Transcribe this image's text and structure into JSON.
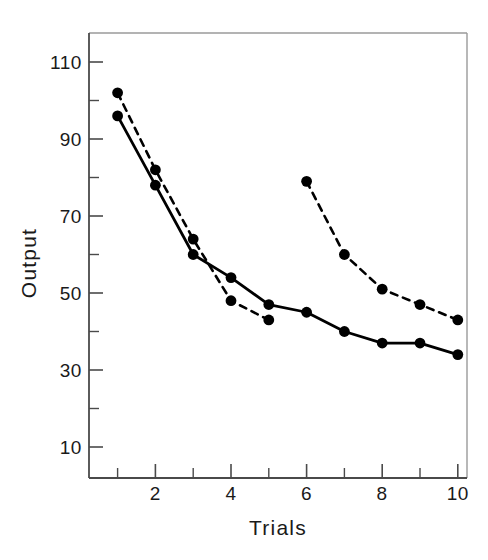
{
  "chart_data": {
    "type": "line",
    "title": "",
    "xlabel": "Trials",
    "ylabel": "Output",
    "x": [
      1,
      2,
      3,
      4,
      5,
      6,
      7,
      8,
      9,
      10
    ],
    "xlim": [
      0.5,
      10.5
    ],
    "ylim": [
      0,
      118
    ],
    "grid": false,
    "legend": "none",
    "xticks": [
      1,
      2,
      3,
      4,
      5,
      6,
      7,
      8,
      9,
      10
    ],
    "xticklabels": [
      "",
      "2",
      "",
      "4",
      "",
      "6",
      "",
      "8",
      "",
      "10"
    ],
    "yticks": [
      10,
      20,
      30,
      40,
      50,
      60,
      70,
      80,
      90,
      100,
      110
    ],
    "yticklabels": [
      "10",
      "",
      "30",
      "",
      "50",
      "",
      "70",
      "",
      "90",
      "",
      "110"
    ],
    "series": [
      {
        "name": "solid-series",
        "style": "solid",
        "marker": "filled-circle",
        "color": "#000000",
        "x": [
          1,
          2,
          3,
          4,
          5,
          6,
          7,
          8,
          9,
          10
        ],
        "values": [
          96,
          78,
          60,
          54,
          47,
          45,
          40,
          37,
          37,
          34
        ]
      },
      {
        "name": "dashed-series-first",
        "style": "dashed",
        "marker": "filled-circle",
        "color": "#000000",
        "x": [
          1,
          2,
          3,
          4,
          5
        ],
        "values": [
          102,
          82,
          64,
          48,
          43
        ]
      },
      {
        "name": "dashed-series-second",
        "style": "dashed",
        "marker": "filled-circle",
        "color": "#000000",
        "x": [
          6,
          7,
          8,
          9,
          10
        ],
        "values": [
          79,
          60,
          51,
          47,
          43
        ]
      }
    ]
  },
  "axes": {
    "y_axis_title": "Output",
    "x_axis_title": "Trials",
    "y_tick_labels": [
      "110",
      "90",
      "70",
      "50",
      "30",
      "10"
    ],
    "x_tick_labels": [
      "2",
      "4",
      "6",
      "8",
      "10"
    ]
  },
  "colors": {
    "ink": "#1a1a1a",
    "frame": "#9a9a9a",
    "data": "#000000",
    "background": "#ffffff"
  }
}
